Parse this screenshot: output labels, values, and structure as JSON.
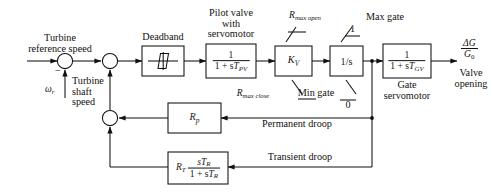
{
  "diagram": {
    "stroke_color": "#111111",
    "background": "#ffffff"
  },
  "inputs": {
    "reference_label_line1": "Turbine",
    "reference_label_line2": "reference speed",
    "minus_sign": "−",
    "omega_symbol": "ω",
    "omega_subscript": "r",
    "shaft_label_line1": "Turbine",
    "shaft_label_line2": "shaft",
    "shaft_label_line3": "speed"
  },
  "blocks": {
    "deadband": {
      "caption": "Deadband",
      "symbol": "deadband-characteristic"
    },
    "pilot_valve": {
      "caption_line1": "Pilot valve",
      "caption_line2": "with",
      "caption_line3": "servomotor",
      "numerator": "1",
      "denominator_prefix": "1 + s",
      "denominator_var": "T",
      "denominator_sub": "PV"
    },
    "kv": {
      "var": "K",
      "sub": "V"
    },
    "integrator": {
      "label": "1/s"
    },
    "gate_servomotor": {
      "caption_line1": "Gate",
      "caption_line2": "servomotor",
      "numerator": "1",
      "denominator_prefix": "1 + s",
      "denominator_var": "T",
      "denominator_sub": "GV"
    },
    "permanent_droop_gain": {
      "var": "R",
      "sub": "p"
    },
    "transient_droop_gain": {
      "var": "R",
      "sub": "T",
      "numerator_prefix": "s",
      "numerator_var": "T",
      "numerator_sub": "R",
      "denominator_prefix": "1 + s",
      "denominator_var": "T",
      "denominator_sub": "R"
    }
  },
  "limits": {
    "rate_max_open": {
      "var": "R",
      "sub": "max open"
    },
    "rate_max_close": {
      "var": "R",
      "sub": "max close"
    },
    "max_gate_label": "Max gate",
    "max_gate_value": "1",
    "min_gate_label": "Min gate",
    "min_gate_value": "0"
  },
  "feedback": {
    "permanent_droop_label": "Permanent droop",
    "transient_droop_label": "Transient droop"
  },
  "output": {
    "numerator": "ΔG",
    "denominator_var": "G",
    "denominator_sub": "0",
    "caption_line1": "Valve",
    "caption_line2": "opening"
  }
}
